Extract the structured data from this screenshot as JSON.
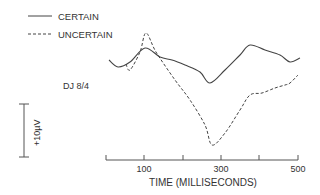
{
  "chart_data": {
    "type": "line",
    "title": "",
    "subject_label": "DJ 8/4",
    "xlabel": "TIME (MILLISECONDS)",
    "ylabel": "",
    "x_ticks": [
      100,
      300,
      500
    ],
    "x_tick_marks": [
      0,
      100,
      200,
      300,
      400,
      500
    ],
    "xlim": [
      0,
      500
    ],
    "scale_bar": {
      "label": "+10µV",
      "orientation": "vertical"
    },
    "grid": false,
    "legend_position": "top-left",
    "legend": [
      {
        "name": "CERTAIN",
        "style": "solid"
      },
      {
        "name": "UNCERTAIN",
        "style": "dashed"
      }
    ],
    "series": [
      {
        "name": "CERTAIN",
        "style": "solid",
        "x": [
          0,
          30,
          60,
          100,
          140,
          180,
          220,
          260,
          280,
          300,
          340,
          370,
          410,
          450,
          480,
          500
        ],
        "points_px": [
          [
            109,
            60
          ],
          [
            118,
            67
          ],
          [
            130,
            62
          ],
          [
            145,
            48
          ],
          [
            160,
            57
          ],
          [
            172,
            60
          ],
          [
            185,
            65
          ],
          [
            200,
            72
          ],
          [
            210,
            83
          ],
          [
            225,
            70
          ],
          [
            240,
            55
          ],
          [
            250,
            45
          ],
          [
            265,
            50
          ],
          [
            280,
            55
          ],
          [
            290,
            62
          ],
          [
            300,
            58
          ]
        ]
      },
      {
        "name": "UNCERTAIN",
        "style": "dashed",
        "points_px": [
          [
            126,
            64
          ],
          [
            130,
            70
          ],
          [
            140,
            52
          ],
          [
            146,
            33
          ],
          [
            156,
            52
          ],
          [
            175,
            80
          ],
          [
            190,
            100
          ],
          [
            205,
            125
          ],
          [
            212,
            145
          ],
          [
            225,
            133
          ],
          [
            240,
            110
          ],
          [
            250,
            95
          ],
          [
            262,
            93
          ],
          [
            275,
            88
          ],
          [
            285,
            85
          ],
          [
            290,
            83
          ],
          [
            298,
            75
          ]
        ]
      }
    ]
  },
  "labels": {
    "legend_certain": "CERTAIN",
    "legend_uncertain": "UNCERTAIN",
    "subject": "DJ 8/4",
    "scale": "+10µV",
    "tick_100": "100",
    "tick_300": "300",
    "tick_500": "500",
    "xlabel": "TIME (MILLISECONDS)"
  }
}
